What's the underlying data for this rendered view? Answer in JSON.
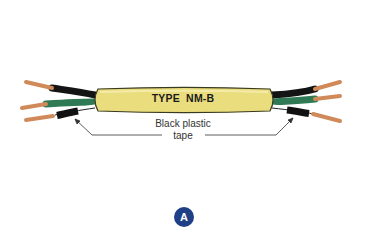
{
  "figure": {
    "cable_label": "TYPE  NM-B",
    "callout": {
      "line1": "Black plastic",
      "line2": "tape"
    },
    "badge": "A"
  },
  "colors": {
    "jacket": "#e9dd7e",
    "jacket_edge": "#3a3a20",
    "copper": "#d08a5a",
    "black_wire": "#141414",
    "green_wire": "#2f7a55",
    "white_wire": "#ffffff",
    "badge": "#1f3f86",
    "leader": "#333333"
  }
}
